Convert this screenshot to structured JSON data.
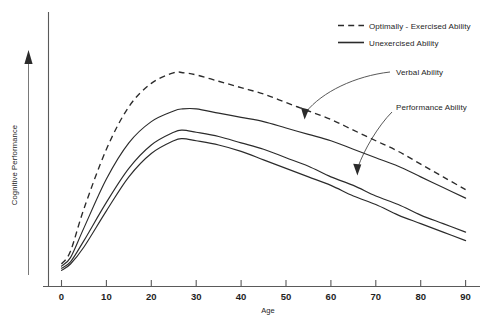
{
  "chart_data": {
    "type": "line",
    "title": "",
    "xlabel": "Age",
    "ylabel": "Cognitive Performance",
    "xlim": [
      0,
      90
    ],
    "ylim": [
      0,
      100
    ],
    "grid": false,
    "xticks": [
      "0",
      "10",
      "20",
      "30",
      "40",
      "50",
      "60",
      "70",
      "80",
      "90"
    ],
    "xtick_values": [
      0,
      10,
      20,
      30,
      40,
      50,
      60,
      70,
      80,
      90
    ],
    "yticks": [],
    "y_axis_style": "arrow-no-ticks",
    "legend": {
      "position": "top-right",
      "entries": [
        {
          "label": "Optimally - Exercised Ability",
          "style": "dashed"
        },
        {
          "label": "Unexercised Ability",
          "style": "solid"
        }
      ]
    },
    "annotations": [
      {
        "label": "Verbal Ability",
        "points_to_series": "Verbal Ability",
        "points_to_age": 61
      },
      {
        "label": "Performance Ability",
        "points_to_series": "Performance Ability",
        "points_to_age": 72
      }
    ],
    "x": [
      0,
      2,
      5,
      10,
      15,
      20,
      25,
      27,
      30,
      35,
      40,
      45,
      50,
      55,
      60,
      65,
      70,
      75,
      80,
      85,
      90
    ],
    "series": [
      {
        "name": "Optimally - Exercised Ability",
        "style": "dashed",
        "values": [
          4,
          10,
          30,
          58,
          78,
          89,
          94,
          94,
          93,
          90,
          87,
          84,
          80,
          76,
          72,
          67,
          62,
          57,
          51,
          45,
          39
        ]
      },
      {
        "name": "Verbal Ability",
        "style": "solid",
        "values": [
          3,
          7,
          21,
          44,
          61,
          71,
          76,
          77,
          77,
          75,
          73,
          71,
          68,
          65,
          62,
          58,
          54,
          50,
          45,
          40,
          35
        ]
      },
      {
        "name": "Performance Ability",
        "style": "solid",
        "values": [
          2,
          5,
          15,
          33,
          49,
          60,
          66,
          67,
          66,
          64,
          61,
          58,
          54,
          50,
          45,
          41,
          36,
          32,
          27,
          23,
          19
        ]
      },
      {
        "name": "Performance Ability (lower)",
        "style": "solid",
        "values": [
          1,
          4,
          12,
          29,
          45,
          56,
          62,
          63,
          62,
          60,
          57,
          53,
          49,
          45,
          41,
          36,
          32,
          27,
          23,
          19,
          15
        ]
      }
    ]
  },
  "axis": {
    "x_title": "Age",
    "y_title": "Cognitive Performance"
  },
  "legend": {
    "entry_optimal": "Optimally - Exercised Ability",
    "entry_unexercised": "Unexercised Ability"
  },
  "annotations": {
    "verbal": "Verbal Ability",
    "performance": "Performance Ability"
  },
  "xticks": {
    "t0": "0",
    "t1": "10",
    "t2": "20",
    "t3": "30",
    "t4": "40",
    "t5": "50",
    "t6": "60",
    "t7": "70",
    "t8": "80",
    "t9": "90"
  },
  "colors": {
    "line": "#2b2b2b",
    "axis": "#5a5a5a",
    "background": "#ffffff"
  }
}
